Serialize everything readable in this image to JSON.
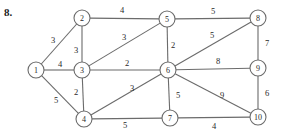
{
  "problem": {
    "number": "8."
  },
  "graph": {
    "type": "weighted-undirected-graph",
    "stroke_color": "#6b6b6b",
    "node_fill": "#ffffff",
    "text_color": "#2a2a2a",
    "node_radius": 8,
    "nodes": [
      {
        "id": "1",
        "label": "1",
        "x": 36,
        "y": 70
      },
      {
        "id": "2",
        "label": "2",
        "x": 82,
        "y": 18
      },
      {
        "id": "3",
        "label": "3",
        "x": 82,
        "y": 70
      },
      {
        "id": "4",
        "label": "4",
        "x": 84,
        "y": 119
      },
      {
        "id": "5",
        "label": "5",
        "x": 167,
        "y": 19
      },
      {
        "id": "6",
        "label": "6",
        "x": 168,
        "y": 70
      },
      {
        "id": "7",
        "label": "7",
        "x": 170,
        "y": 118
      },
      {
        "id": "8",
        "label": "8",
        "x": 258,
        "y": 18
      },
      {
        "id": "9",
        "label": "9",
        "x": 258,
        "y": 68
      },
      {
        "id": "10",
        "label": "10",
        "x": 258,
        "y": 117
      }
    ],
    "edges": [
      {
        "from": "1",
        "to": "2",
        "weight": "3",
        "lx": 53,
        "ly": 40
      },
      {
        "from": "1",
        "to": "3",
        "weight": "4",
        "lx": 60,
        "ly": 64
      },
      {
        "from": "1",
        "to": "4",
        "weight": "5",
        "lx": 56,
        "ly": 100
      },
      {
        "from": "2",
        "to": "3",
        "weight": "3",
        "lx": 76,
        "ly": 50
      },
      {
        "from": "2",
        "to": "5",
        "weight": "4",
        "lx": 122,
        "ly": 10
      },
      {
        "from": "3",
        "to": "4",
        "weight": "2",
        "lx": 76,
        "ly": 92
      },
      {
        "from": "3",
        "to": "5",
        "weight": "3",
        "lx": 124,
        "ly": 37
      },
      {
        "from": "3",
        "to": "6",
        "weight": "2",
        "lx": 127,
        "ly": 63
      },
      {
        "from": "4",
        "to": "6",
        "weight": "3",
        "lx": 132,
        "ly": 88
      },
      {
        "from": "4",
        "to": "7",
        "weight": "5",
        "lx": 125,
        "ly": 125
      },
      {
        "from": "5",
        "to": "6",
        "weight": "2",
        "lx": 173,
        "ly": 45
      },
      {
        "from": "5",
        "to": "8",
        "weight": "5",
        "lx": 213,
        "ly": 11
      },
      {
        "from": "6",
        "to": "7",
        "weight": "5",
        "lx": 178,
        "ly": 95
      },
      {
        "from": "6",
        "to": "8",
        "weight": "5",
        "lx": 212,
        "ly": 35
      },
      {
        "from": "6",
        "to": "9",
        "weight": "8",
        "lx": 218,
        "ly": 61
      },
      {
        "from": "6",
        "to": "10",
        "weight": "9",
        "lx": 222,
        "ly": 95
      },
      {
        "from": "7",
        "to": "10",
        "weight": "4",
        "lx": 214,
        "ly": 126
      },
      {
        "from": "8",
        "to": "9",
        "weight": "7",
        "lx": 267,
        "ly": 43
      },
      {
        "from": "9",
        "to": "10",
        "weight": "6",
        "lx": 267,
        "ly": 93
      }
    ]
  }
}
